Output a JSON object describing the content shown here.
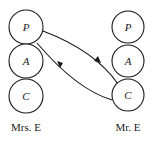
{
  "diagram": {
    "type": "transactional-analysis-crossed-transaction",
    "persons": [
      {
        "name": "Mrs. E",
        "ego_states": [
          {
            "id": "P",
            "label": "P"
          },
          {
            "id": "A",
            "label": "A"
          },
          {
            "id": "C",
            "label": "C"
          }
        ]
      },
      {
        "name": "Mr. E",
        "ego_states": [
          {
            "id": "P",
            "label": "P"
          },
          {
            "id": "A",
            "label": "A"
          },
          {
            "id": "C",
            "label": "C"
          }
        ]
      }
    ],
    "transactions": [
      {
        "from": "Mrs. E.P",
        "to": "Mr. E.C",
        "direction": "down-right"
      },
      {
        "from": "Mr. E.C",
        "to": "Mrs. E.P",
        "direction": "up-left"
      }
    ],
    "colors": {
      "stroke": "#1a1a1a",
      "background": "#ffffff"
    }
  }
}
